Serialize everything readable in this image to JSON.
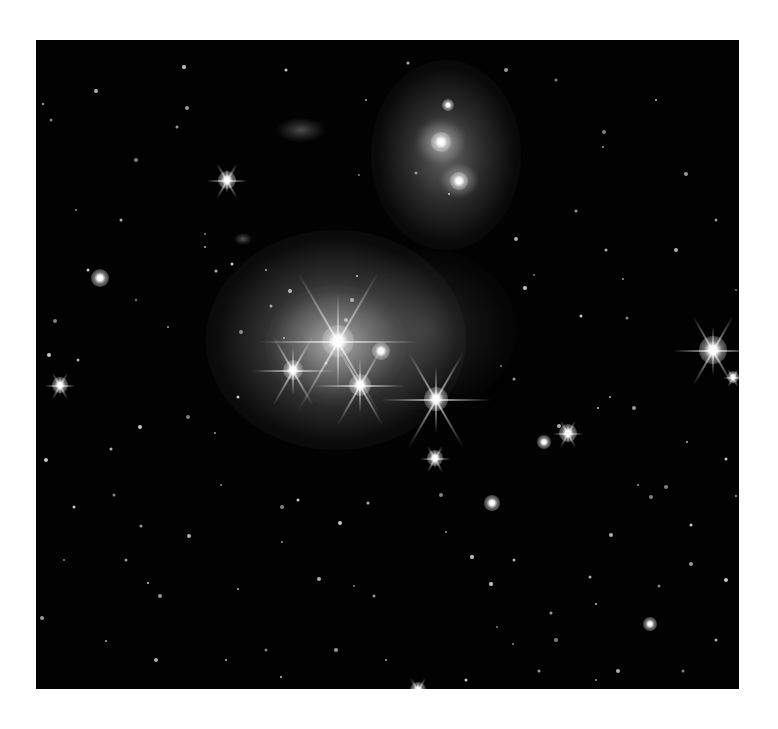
{
  "image": {
    "description": "Deep-sky astronomical photograph: a star cluster embedded in a reflection nebula, with a bright double-lobed nebula to the upper right, on a black star field inside a white border",
    "frame": {
      "left": 36,
      "top": 40,
      "width": 703,
      "height": 649
    },
    "colors": {
      "border": "#ffffff",
      "sky": "#020202",
      "nebula": "#c8c8c8",
      "star": "#ffffff"
    }
  },
  "nebulae": [
    {
      "name": "central-cluster-nebula",
      "x": 300,
      "y": 300,
      "rx": 130,
      "ry": 110,
      "opacity": 0.55
    },
    {
      "name": "central-cluster-core",
      "x": 300,
      "y": 305,
      "rx": 70,
      "ry": 60,
      "opacity": 0.55
    },
    {
      "name": "upper-right-nebula-glow",
      "x": 410,
      "y": 115,
      "rx": 75,
      "ry": 95,
      "opacity": 0.45
    },
    {
      "name": "upper-nebula-lobe-1",
      "x": 405,
      "y": 102,
      "rx": 26,
      "ry": 24,
      "opacity": 0.8
    },
    {
      "name": "upper-nebula-lobe-2",
      "x": 423,
      "y": 140,
      "rx": 20,
      "ry": 18,
      "opacity": 0.75
    },
    {
      "name": "small-wisp-nebula",
      "x": 265,
      "y": 90,
      "rx": 24,
      "ry": 12,
      "opacity": 0.35
    },
    {
      "name": "comet-wisp",
      "x": 207,
      "y": 199,
      "rx": 9,
      "ry": 6,
      "opacity": 0.4
    },
    {
      "name": "nebula-haze-mid",
      "x": 390,
      "y": 290,
      "rx": 90,
      "ry": 80,
      "opacity": 0.18
    }
  ],
  "bright_stars": [
    {
      "x": 302,
      "y": 301,
      "size": 16,
      "spikes": 80
    },
    {
      "x": 345,
      "y": 311,
      "size": 9,
      "spikes": 0
    },
    {
      "x": 257,
      "y": 330,
      "size": 10,
      "spikes": 40
    },
    {
      "x": 324,
      "y": 345,
      "size": 11,
      "spikes": 45
    },
    {
      "x": 400,
      "y": 359,
      "size": 12,
      "spikes": 55
    },
    {
      "x": 191,
      "y": 140,
      "size": 9,
      "spikes": 20
    },
    {
      "x": 677,
      "y": 310,
      "size": 14,
      "spikes": 40
    },
    {
      "x": 405,
      "y": 102,
      "size": 10,
      "spikes": 0
    },
    {
      "x": 423,
      "y": 141,
      "size": 9,
      "spikes": 0
    },
    {
      "x": 412,
      "y": 65,
      "size": 6,
      "spikes": 0
    },
    {
      "x": 64,
      "y": 238,
      "size": 9,
      "spikes": 0
    },
    {
      "x": 24,
      "y": 345,
      "size": 8,
      "spikes": 15
    },
    {
      "x": 399,
      "y": 418,
      "size": 8,
      "spikes": 15
    },
    {
      "x": 532,
      "y": 393,
      "size": 9,
      "spikes": 15
    },
    {
      "x": 508,
      "y": 402,
      "size": 7,
      "spikes": 0
    },
    {
      "x": 456,
      "y": 463,
      "size": 8,
      "spikes": 0
    },
    {
      "x": 697,
      "y": 337,
      "size": 6,
      "spikes": 10
    },
    {
      "x": 614,
      "y": 584,
      "size": 7,
      "spikes": 0
    },
    {
      "x": 382,
      "y": 650,
      "size": 8,
      "spikes": 15
    }
  ],
  "faint_stars": [
    [
      465,
      326
    ],
    [
      478,
      339
    ],
    [
      523,
      386
    ],
    [
      562,
      368
    ],
    [
      591,
      278
    ],
    [
      650,
      134
    ],
    [
      574,
      357
    ],
    [
      545,
      276
    ],
    [
      568,
      92
    ],
    [
      567,
      107
    ],
    [
      372,
      23
    ],
    [
      148,
      27
    ],
    [
      323,
      135
    ],
    [
      141,
      87
    ],
    [
      60,
      51
    ],
    [
      7,
      64
    ],
    [
      15,
      80
    ],
    [
      151,
      68
    ],
    [
      169,
      207
    ],
    [
      52,
      230
    ],
    [
      19,
      281
    ],
    [
      132,
      287
    ],
    [
      180,
      231
    ],
    [
      13,
      315
    ],
    [
      169,
      194
    ],
    [
      235,
      266
    ],
    [
      254,
      251
    ],
    [
      321,
      236
    ],
    [
      290,
      323
    ],
    [
      310,
      280
    ],
    [
      248,
      298
    ],
    [
      202,
      357
    ],
    [
      152,
      377
    ],
    [
      179,
      393
    ],
    [
      75,
      409
    ],
    [
      104,
      387
    ],
    [
      185,
      445
    ],
    [
      105,
      486
    ],
    [
      153,
      496
    ],
    [
      112,
      543
    ],
    [
      78,
      455
    ],
    [
      124,
      556
    ],
    [
      202,
      549
    ],
    [
      262,
      460
    ],
    [
      246,
      467
    ],
    [
      246,
      502
    ],
    [
      332,
      463
    ],
    [
      304,
      483
    ],
    [
      318,
      546
    ],
    [
      338,
      556
    ],
    [
      283,
      539
    ],
    [
      245,
      637
    ],
    [
      60,
      660
    ],
    [
      6,
      578
    ],
    [
      70,
      601
    ],
    [
      38,
      467
    ],
    [
      405,
      455
    ],
    [
      410,
      492
    ],
    [
      478,
      520
    ],
    [
      455,
      544
    ],
    [
      477,
      604
    ],
    [
      515,
      573
    ],
    [
      575,
      495
    ],
    [
      560,
      564
    ],
    [
      623,
      546
    ],
    [
      655,
      524
    ],
    [
      700,
      456
    ],
    [
      655,
      485
    ],
    [
      615,
      457
    ],
    [
      602,
      445
    ],
    [
      554,
      537
    ],
    [
      436,
      517
    ],
    [
      461,
      587
    ],
    [
      503,
      631
    ],
    [
      582,
      631
    ],
    [
      612,
      661
    ],
    [
      647,
      631
    ],
    [
      598,
      368
    ],
    [
      651,
      402
    ],
    [
      690,
      419
    ],
    [
      630,
      447
    ],
    [
      587,
      239
    ],
    [
      570,
      210
    ],
    [
      489,
      248
    ],
    [
      498,
      235
    ],
    [
      540,
      171
    ],
    [
      480,
      199
    ],
    [
      413,
      154
    ],
    [
      380,
      133
    ],
    [
      316,
      260
    ],
    [
      230,
      230
    ],
    [
      196,
      224
    ],
    [
      205,
      292
    ],
    [
      100,
      260
    ],
    [
      42,
      320
    ],
    [
      10,
      420
    ],
    [
      28,
      520
    ],
    [
      90,
      520
    ],
    [
      120,
      620
    ],
    [
      190,
      620
    ],
    [
      230,
      610
    ],
    [
      300,
      610
    ],
    [
      350,
      620
    ],
    [
      430,
      640
    ],
    [
      520,
      600
    ],
    [
      560,
      640
    ],
    [
      680,
      600
    ],
    [
      690,
      540
    ],
    [
      700,
      250
    ],
    [
      680,
      180
    ],
    [
      640,
      210
    ],
    [
      620,
      60
    ],
    [
      520,
      40
    ],
    [
      470,
      30
    ],
    [
      330,
      60
    ],
    [
      250,
      30
    ],
    [
      100,
      120
    ],
    [
      40,
      170
    ],
    [
      85,
      180
    ]
  ]
}
